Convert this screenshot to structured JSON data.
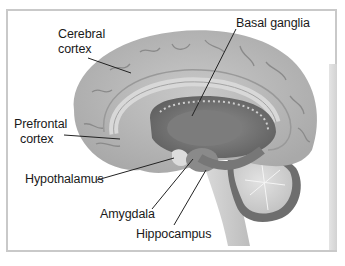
{
  "figure": {
    "labels": {
      "cerebral_cortex_line1": "Cerebral",
      "cerebral_cortex_line2": "cortex",
      "basal_ganglia": "Basal ganglia",
      "prefrontal_cortex_line1": "Prefrontal",
      "prefrontal_cortex_line2": "cortex",
      "hypothalamus": "Hypothalamus",
      "amygdala": "Amygdala",
      "hippocampus": "Hippocampus"
    },
    "colors": {
      "frame_border": "#c9c9c9",
      "brain_tissue": "#bdbdbd",
      "brain_dark": "#7a7a7a",
      "label_text": "#1a1a1a",
      "leader_line": "#222222"
    }
  }
}
